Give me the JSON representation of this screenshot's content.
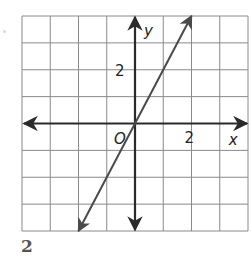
{
  "problem": {
    "number": "2"
  },
  "chart_data": {
    "type": "line",
    "title": "",
    "xlabel": "x",
    "ylabel": "y",
    "origin_label": "O",
    "xlim": [
      -4,
      4
    ],
    "ylim": [
      -4,
      4
    ],
    "grid": true,
    "tick_labels": {
      "x": [
        "2"
      ],
      "y": [
        "2"
      ]
    },
    "series": [
      {
        "name": "line",
        "equation": "y = 2x",
        "x": [
          -2,
          0,
          1,
          2
        ],
        "y": [
          -4,
          0,
          2,
          4
        ],
        "arrows_both_ends": true
      }
    ]
  },
  "colors": {
    "grid": "#8a8a8a",
    "axes": "#2a2a2a",
    "line": "#4a4a4a",
    "text": "#222222"
  }
}
